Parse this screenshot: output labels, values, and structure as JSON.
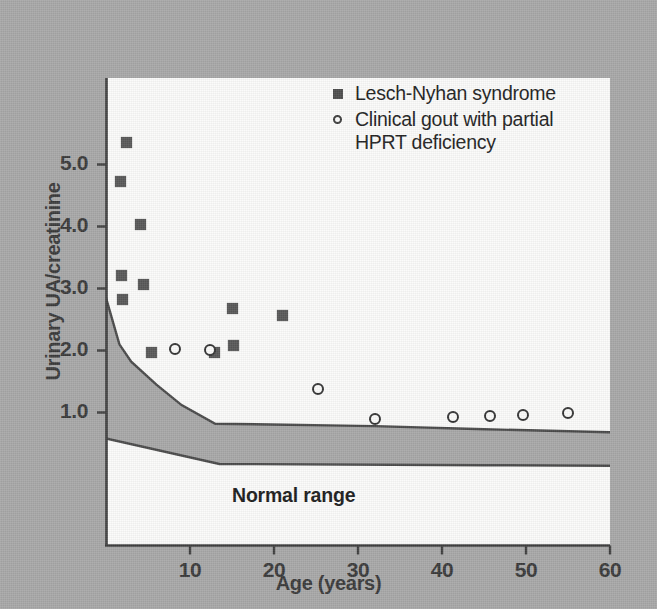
{
  "chart_data": {
    "type": "scatter",
    "title": "",
    "xlabel": "Age (years)",
    "ylabel": "Urinary UA/creatinine",
    "xlim": [
      0,
      60
    ],
    "ylim": [
      0,
      5.6
    ],
    "xticks": [
      10,
      20,
      30,
      40,
      50,
      60
    ],
    "yticks": [
      1.0,
      2.0,
      3.0,
      4.0,
      5.0
    ],
    "xtick_labels": [
      "10",
      "20",
      "30",
      "40",
      "50",
      "60"
    ],
    "ytick_labels": [
      "1.0",
      "2.0",
      "3.0",
      "4.0",
      "5.0"
    ],
    "grid": false,
    "legend_position": "top-right",
    "series": [
      {
        "name": "Lesch-Nyhan syndrome",
        "marker": "filled-square",
        "color": "#585858",
        "points": [
          {
            "x": 2.4,
            "y": 5.35
          },
          {
            "x": 1.7,
            "y": 4.72
          },
          {
            "x": 4.1,
            "y": 4.03
          },
          {
            "x": 1.9,
            "y": 3.21
          },
          {
            "x": 4.5,
            "y": 3.06
          },
          {
            "x": 2.0,
            "y": 2.82
          },
          {
            "x": 15.0,
            "y": 2.68
          },
          {
            "x": 21.0,
            "y": 2.57
          },
          {
            "x": 5.4,
            "y": 1.97
          },
          {
            "x": 12.9,
            "y": 1.96
          },
          {
            "x": 15.2,
            "y": 2.08
          }
        ]
      },
      {
        "name": "Clinical gout with partial HPRT deficiency",
        "marker": "open-circle",
        "color": "#333333",
        "points": [
          {
            "x": 8.2,
            "y": 2.03
          },
          {
            "x": 12.4,
            "y": 2.01
          },
          {
            "x": 25.2,
            "y": 1.38
          },
          {
            "x": 32.0,
            "y": 0.89
          },
          {
            "x": 41.3,
            "y": 0.93
          },
          {
            "x": 45.7,
            "y": 0.95
          },
          {
            "x": 49.6,
            "y": 0.96
          },
          {
            "x": 55.0,
            "y": 0.99
          }
        ]
      }
    ],
    "bands": [
      {
        "name": "Normal range",
        "label": "Normal range",
        "fill_color": "#a8a8a8",
        "line_color": "#4a4a4a",
        "upper": [
          {
            "x": 0,
            "y": 2.85
          },
          {
            "x": 1.6,
            "y": 2.1
          },
          {
            "x": 3.0,
            "y": 1.82
          },
          {
            "x": 6.0,
            "y": 1.45
          },
          {
            "x": 9.0,
            "y": 1.12
          },
          {
            "x": 13.0,
            "y": 0.82
          },
          {
            "x": 32.0,
            "y": 0.78
          },
          {
            "x": 45.0,
            "y": 0.73
          },
          {
            "x": 60.0,
            "y": 0.68
          }
        ],
        "lower": [
          {
            "x": 0,
            "y": 0.58
          },
          {
            "x": 13.5,
            "y": 0.17
          },
          {
            "x": 45.0,
            "y": 0.15
          },
          {
            "x": 60.0,
            "y": 0.14
          }
        ]
      }
    ]
  },
  "axes": {
    "y_title": "Urinary UA/creatinine",
    "x_title": "Age (years)"
  },
  "legend": {
    "entries": [
      {
        "marker": "filled-square",
        "label": "Lesch-Nyhan syndrome"
      },
      {
        "marker": "open-circle",
        "label": "Clinical gout with partial\nHPRT deficiency"
      }
    ]
  },
  "annotations": {
    "normal_range": "Normal range"
  },
  "colors": {
    "background": "#a8a8a8",
    "plot_background": "#fbfbfa",
    "axis": "#3a3a3a",
    "square_marker": "#585858",
    "circle_marker": "#333333",
    "band_fill": "#a8a8a8"
  }
}
